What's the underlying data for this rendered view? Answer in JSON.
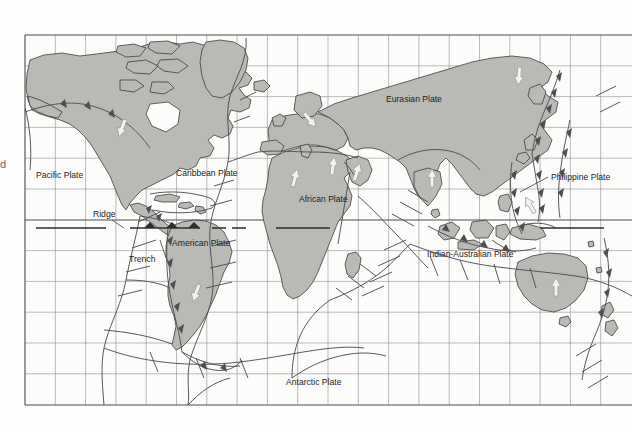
{
  "figure": {
    "kind": "world-tectonic-plate-map",
    "projection": "cylindrical-equidistant",
    "edge_fragment": "d"
  },
  "colors": {
    "page_background": "#fdfdfc",
    "ocean": "#fcfcfa",
    "land_fill": "#b9b9b5",
    "land_stroke": "#3c3c3c",
    "grid_line": "#8d8d93",
    "frame_line": "#4a4a4a",
    "boundary_line": "#4f4f52",
    "equator_line": "#2e2e2e",
    "label_text": "#1d1d1d",
    "arrow_fill": "#f2f2ef",
    "arrow_stroke": "#9a9a96"
  },
  "frame": {
    "left": 25,
    "top": 35,
    "right": 632,
    "bottom": 405,
    "grid_step_x": 30.3,
    "grid_step_y": 30.8,
    "equator_y": 220
  },
  "plate_labels": [
    {
      "id": "pacific-plate",
      "text": "Pacific Plate",
      "x": 36,
      "y": 178,
      "anchor": "start"
    },
    {
      "id": "caribbean-plate",
      "text": "Caribbean Plate",
      "x": 176,
      "y": 176,
      "anchor": "start"
    },
    {
      "id": "american-plate",
      "text": "American Plate",
      "x": 172,
      "y": 246,
      "anchor": "start"
    },
    {
      "id": "african-plate",
      "text": "African Plate",
      "x": 299,
      "y": 202,
      "anchor": "start"
    },
    {
      "id": "eurasian-plate",
      "text": "Eurasian Plate",
      "x": 386,
      "y": 102,
      "anchor": "start"
    },
    {
      "id": "philippine-plate",
      "text": "Philippine Plate",
      "x": 551,
      "y": 180,
      "anchor": "start"
    },
    {
      "id": "indian-australian-plate",
      "text": "Indian-Australian Plate",
      "x": 427,
      "y": 257,
      "anchor": "start"
    },
    {
      "id": "antarctic-plate",
      "text": "Antarctic Plate",
      "x": 286,
      "y": 385,
      "anchor": "start"
    }
  ],
  "feature_labels": [
    {
      "id": "ridge",
      "text": "Ridge",
      "x": 93,
      "y": 217,
      "anchor": "start"
    },
    {
      "id": "trench",
      "text": "Trench",
      "x": 129,
      "y": 262,
      "anchor": "start"
    }
  ],
  "legend_symbols": [
    {
      "id": "ridge-symbol",
      "type": "plain-line",
      "x1": 36,
      "x2": 106,
      "y": 228
    },
    {
      "id": "trench-symbol",
      "type": "barbed-line",
      "x1": 130,
      "x2": 200,
      "y": 228
    }
  ],
  "motion_arrows": [
    {
      "id": "arrow-north-america",
      "x": 122,
      "y": 128,
      "rot": 200
    },
    {
      "id": "arrow-south-america",
      "x": 196,
      "y": 293,
      "rot": 200
    },
    {
      "id": "arrow-west-africa",
      "x": 295,
      "y": 178,
      "rot": 15
    },
    {
      "id": "arrow-ne-africa",
      "x": 333,
      "y": 166,
      "rot": 8
    },
    {
      "id": "arrow-arabia",
      "x": 357,
      "y": 172,
      "rot": 18
    },
    {
      "id": "arrow-india",
      "x": 432,
      "y": 178,
      "rot": 0
    },
    {
      "id": "arrow-siberia",
      "x": 519,
      "y": 76,
      "rot": 185
    },
    {
      "id": "arrow-eurasia-w",
      "x": 310,
      "y": 120,
      "rot": 140
    },
    {
      "id": "arrow-australia",
      "x": 556,
      "y": 287,
      "rot": 0
    },
    {
      "id": "arrow-philippine",
      "x": 530,
      "y": 205,
      "rot": 330
    }
  ]
}
